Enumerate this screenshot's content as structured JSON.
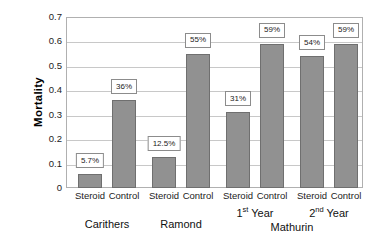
{
  "chart_data": {
    "type": "bar",
    "title": "",
    "xlabel": "",
    "ylabel": "Mortality",
    "ylim": [
      0,
      0.7
    ],
    "ytick_values": [
      0.7,
      0.6,
      0.5,
      0.4,
      0.3,
      0.2,
      0.1,
      0
    ],
    "ytick_labels": [
      "0.7",
      "0.6",
      "0.5",
      "0.4",
      "0.3",
      "0.2",
      "0.1",
      "0"
    ],
    "grid": "horizontal",
    "legend": "none",
    "categories": [
      "Steroid",
      "Control",
      "Steroid",
      "Control",
      "Steroid",
      "Control",
      "Steroid",
      "Control"
    ],
    "values": [
      0.057,
      0.36,
      0.125,
      0.55,
      0.31,
      0.59,
      0.54,
      0.59
    ],
    "data_labels": [
      "5.7%",
      "36%",
      "12.5%",
      "55%",
      "31%",
      "59%",
      "54%",
      "59%"
    ],
    "bar_color": "#919191",
    "bar_edge_color": "#6f6f6f",
    "groups": [
      {
        "label": "Carithers",
        "bars": [
          0,
          1
        ]
      },
      {
        "label": "Ramond",
        "bars": [
          2,
          3
        ]
      },
      {
        "label": "1st Year",
        "sup": "st",
        "base": "1",
        "tail": " Year",
        "bars": [
          4,
          5
        ]
      },
      {
        "label": "2nd Year",
        "sup": "nd",
        "base": "2",
        "tail": " Year",
        "bars": [
          6,
          7
        ]
      }
    ],
    "supergroups": [
      {
        "label": "Mathurin",
        "bars": [
          4,
          5,
          6,
          7
        ]
      }
    ]
  }
}
